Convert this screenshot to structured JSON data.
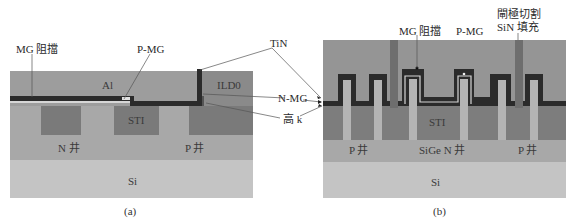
{
  "panel_a": {
    "caption": "(a)",
    "labels": {
      "mg_block": "MG 阻擋",
      "p_mg": "P-MG",
      "al": "Al",
      "ild0": "ILD0",
      "sti": "STI",
      "n_well": "N 井",
      "p_well": "P 井",
      "si": "Si"
    }
  },
  "panel_b": {
    "caption": "(b)",
    "labels": {
      "mg_block": "MG 阻擋",
      "p_mg": "P-MG",
      "gate_cut_line1": "閘極切割",
      "gate_cut_line2": "SiN 填充",
      "sti": "STI",
      "p_well_left": "P 井",
      "sige_n_well": "SiGe N 井",
      "p_well_right": "P 井",
      "si": "Si"
    }
  },
  "shared_labels": {
    "tin": "TiN",
    "n_mg": "N-MG",
    "high_k": "高 k"
  },
  "colors": {
    "al_fill": "#9b9b9b",
    "ild0_fill": "#8a8a8a",
    "sti_fill": "#7a7a7a",
    "well_fill": "#a8a8a8",
    "si_fill": "#c4c4c4",
    "metal_dark": "#2b2b2b",
    "fin_fill": "#b4b4b4",
    "gate_cut": "#6e6e6e"
  }
}
